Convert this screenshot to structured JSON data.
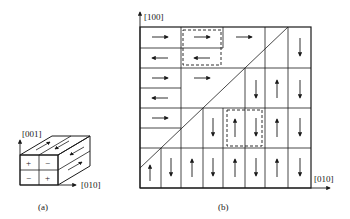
{
  "panel_a": {
    "caption": "(a)",
    "axis_vertical": "[001]",
    "axis_horizontal": "[010]",
    "front_face_signs": [
      "+",
      "−",
      "−",
      "+"
    ]
  },
  "panel_b": {
    "caption": "(b)",
    "axis_vertical": "[100]",
    "axis_horizontal": "[010]"
  },
  "colors": {
    "line": "#1a1a1a",
    "arrow": "#1a1a1a",
    "background": "#ffffff"
  }
}
